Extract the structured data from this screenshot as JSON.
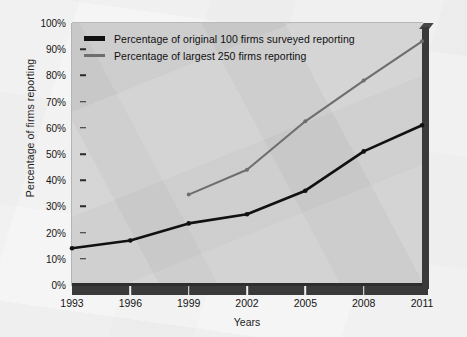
{
  "chart_data": {
    "type": "line",
    "title": "",
    "xlabel": "Years",
    "ylabel": "Percentage of firms reporting",
    "categories": [
      "1993",
      "1996",
      "1999",
      "2002",
      "2005",
      "2008",
      "2011"
    ],
    "x": [
      1993,
      1996,
      1999,
      2002,
      2005,
      2008,
      2011
    ],
    "xlim": [
      1993,
      2011
    ],
    "ylim": [
      0,
      100
    ],
    "ytick_labels": [
      "0%",
      "10%",
      "20%",
      "30%",
      "40%",
      "50%",
      "60%",
      "70%",
      "80%",
      "90%",
      "100%"
    ],
    "ytick_values": [
      0,
      10,
      20,
      30,
      40,
      50,
      60,
      70,
      80,
      90,
      100
    ],
    "grid": false,
    "legend_position": "top-left",
    "series": [
      {
        "name": "Percentage of original 100 firms surveyed reporting",
        "color": "#111111",
        "values": [
          14,
          17,
          23.5,
          27,
          36,
          51,
          61
        ]
      },
      {
        "name": "Percentage of largest 250 firms reporting",
        "color": "#6e6e6e",
        "values": [
          null,
          null,
          34.5,
          44,
          62.5,
          78,
          93
        ]
      }
    ]
  },
  "legend": {
    "items": [
      {
        "label": "Percentage of original 100 firms surveyed reporting",
        "swatch": "black-line-swatch"
      },
      {
        "label": "Percentage of largest 250 firms reporting",
        "swatch": "gray-line-swatch"
      }
    ]
  },
  "axes": {
    "x_title": "Years",
    "y_title": "Percentage of firms reporting"
  }
}
